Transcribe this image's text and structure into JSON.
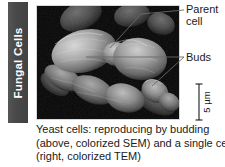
{
  "figure": {
    "category_tab": {
      "label": "Fungal Cells",
      "background_color": "#4a4a4a",
      "text_color": "#ffffff"
    },
    "micrograph": {
      "name": "yeast-cells-sem-micrograph",
      "background_color": "#050505",
      "description": "Colorized scanning electron micrograph of budding yeast cells"
    },
    "callouts": [
      {
        "id": "parent",
        "line1": "Parent",
        "line2": "cell"
      },
      {
        "id": "buds",
        "line1": "Buds",
        "line2": ""
      }
    ],
    "scale_bar": {
      "value": "5",
      "unit": "µm",
      "text": "5 µm"
    },
    "caption": {
      "line1": "Yeast cells: reproducing by budding",
      "line2": "(above, colorized SEM) and a single cell",
      "line3": "(right, colorized TEM)"
    },
    "colors": {
      "text": "#1a1a1a",
      "leader_line": "#6a6a6a",
      "page_background": "#ffffff"
    }
  }
}
